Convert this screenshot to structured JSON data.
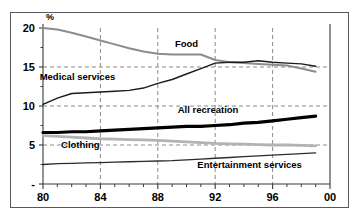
{
  "chart_data": {
    "type": "line",
    "title": "",
    "subtitle": "",
    "xlabel": "",
    "ylabel": "%",
    "ylabel_position": "top-left-of-axis",
    "xlim": [
      80,
      100
    ],
    "ylim": [
      0,
      20
    ],
    "yticks": [
      0,
      5,
      10,
      15,
      20
    ],
    "ytick_labels": [
      "-",
      "5",
      "10",
      "15",
      "20"
    ],
    "xticks": [
      80,
      84,
      88,
      92,
      96,
      100
    ],
    "xtick_labels": [
      "80",
      "84",
      "88",
      "92",
      "96",
      "00"
    ],
    "x_minor_tick_interval": 1,
    "grid": {
      "horizontal": "dashed at 5, 10, 15",
      "vertical": "dashed at 84, 88, 92, 96",
      "color": "#8a8a8a"
    },
    "legend": "inline-labels",
    "x": [
      80,
      81,
      82,
      83,
      84,
      85,
      86,
      87,
      88,
      89,
      90,
      91,
      92,
      93,
      94,
      95,
      96,
      97,
      98,
      99
    ],
    "series": [
      {
        "name": "Food",
        "color": "#8c8c8c",
        "width": 2.0,
        "label_x": 90.0,
        "label_y": 17.6,
        "values": [
          20.0,
          19.8,
          19.4,
          18.9,
          18.4,
          17.9,
          17.4,
          17.0,
          16.7,
          16.6,
          16.6,
          16.6,
          15.9,
          15.6,
          15.5,
          15.4,
          15.3,
          15.2,
          14.8,
          14.4
        ]
      },
      {
        "name": "Medical services",
        "color": "#1a1a1a",
        "width": 1.4,
        "label_x": 82.4,
        "label_y": 13.3,
        "values": [
          10.2,
          11.0,
          11.6,
          11.7,
          11.8,
          11.9,
          12.0,
          12.3,
          12.9,
          13.4,
          14.1,
          14.8,
          15.5,
          15.6,
          15.6,
          15.8,
          15.6,
          15.5,
          15.4,
          15.1
        ]
      },
      {
        "name": "All recreation",
        "color": "#000000",
        "width": 3.2,
        "label_x": 91.5,
        "label_y": 9.1,
        "values": [
          6.6,
          6.6,
          6.7,
          6.7,
          6.8,
          6.9,
          7.0,
          7.1,
          7.2,
          7.3,
          7.4,
          7.4,
          7.5,
          7.6,
          7.8,
          7.9,
          8.1,
          8.3,
          8.5,
          8.7
        ]
      },
      {
        "name": "Clothing",
        "color": "#b3b3b3",
        "width": 2.8,
        "label_x": 82.6,
        "label_y": 4.6,
        "values": [
          6.2,
          6.1,
          6.0,
          5.9,
          5.8,
          5.75,
          5.7,
          5.65,
          5.6,
          5.5,
          5.4,
          5.3,
          5.2,
          5.15,
          5.1,
          5.05,
          5.0,
          5.0,
          4.95,
          4.9
        ]
      },
      {
        "name": "Entertainment services",
        "color": "#2b2b2b",
        "width": 1.3,
        "label_x": 94.4,
        "label_y": 2.1,
        "values": [
          2.5,
          2.6,
          2.65,
          2.7,
          2.75,
          2.8,
          2.85,
          2.9,
          2.95,
          3.0,
          3.1,
          3.2,
          3.3,
          3.4,
          3.5,
          3.6,
          3.7,
          3.8,
          3.9,
          4.0
        ]
      }
    ]
  }
}
